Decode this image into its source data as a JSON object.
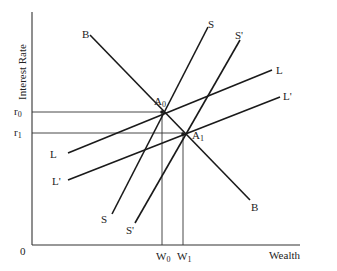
{
  "diagram": {
    "y_axis_label": "Interest Rate",
    "x_axis_label": "Wealth",
    "origin_label": "0",
    "y_ticks": [
      {
        "label": "r",
        "sub": "0",
        "y": 112
      },
      {
        "label": "r",
        "sub": "1",
        "y": 133
      }
    ],
    "x_ticks": [
      {
        "label": "W",
        "sub": "0",
        "x": 162
      },
      {
        "label": "W",
        "sub": "1",
        "x": 183
      }
    ],
    "curves": [
      {
        "name": "B",
        "start_label": "B",
        "end_label": "B",
        "from": [
          90,
          35
        ],
        "to": [
          250,
          200
        ]
      },
      {
        "name": "S",
        "start_label": "S",
        "end_label": "S",
        "from": [
          112,
          214
        ],
        "to": [
          208,
          27
        ]
      },
      {
        "name": "S'",
        "start_label": "S'",
        "end_label": "S'",
        "from": [
          135,
          223
        ],
        "to": [
          240,
          40
        ]
      },
      {
        "name": "L",
        "start_label": "L",
        "end_label": "L",
        "from": [
          68,
          153
        ],
        "to": [
          272,
          70
        ]
      },
      {
        "name": "L'",
        "start_label": "L'",
        "end_label": "L'",
        "from": [
          68,
          180
        ],
        "to": [
          280,
          97
        ]
      }
    ],
    "points": [
      {
        "label": "A",
        "sub": "0",
        "x": 162,
        "y": 112
      },
      {
        "label": "A",
        "sub": "1",
        "x": 183,
        "y": 134
      }
    ],
    "colors": {
      "line": "#1a1a1a",
      "text": "#222222",
      "background": "#ffffff"
    }
  }
}
